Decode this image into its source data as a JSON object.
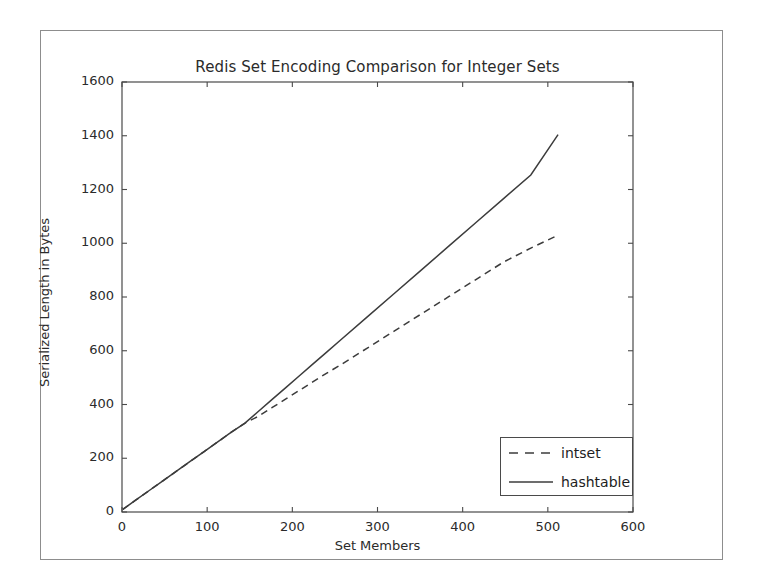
{
  "chart_data": {
    "type": "line",
    "title": "Redis Set Encoding Comparison for Integer Sets",
    "xlabel": "Set Members",
    "ylabel": "Serialized Length in Bytes",
    "xlim": [
      0,
      600
    ],
    "ylim": [
      0,
      1600
    ],
    "xticks": [
      0,
      100,
      200,
      300,
      400,
      500,
      600
    ],
    "yticks": [
      0,
      200,
      400,
      600,
      800,
      1000,
      1200,
      1400,
      1600
    ],
    "xtick_labels": [
      "0",
      "100",
      "200",
      "300",
      "400",
      "500",
      "600"
    ],
    "ytick_labels": [
      "0",
      "200",
      "400",
      "600",
      "800",
      "1000",
      "1200",
      "1400",
      "1600"
    ],
    "grid": false,
    "legend_position": "lower right",
    "series": [
      {
        "name": "intset",
        "style": "dashed",
        "color": "#3c3c3c",
        "x": [
          1,
          16,
          32,
          48,
          64,
          80,
          96,
          112,
          128,
          144,
          160,
          176,
          192,
          208,
          224,
          240,
          256,
          288,
          320,
          352,
          384,
          416,
          448,
          480,
          512
        ],
        "y": [
          10,
          44,
          80,
          116,
          152,
          188,
          224,
          260,
          296,
          330,
          356,
          388,
          420,
          452,
          484,
          516,
          546,
          610,
          674,
          738,
          802,
          866,
          930,
          982,
          1030
        ]
      },
      {
        "name": "hashtable",
        "style": "solid",
        "color": "#3c3c3c",
        "x": [
          1,
          16,
          32,
          48,
          64,
          80,
          96,
          112,
          128,
          144,
          160,
          176,
          192,
          208,
          224,
          240,
          256,
          288,
          320,
          352,
          384,
          416,
          448,
          480,
          512
        ],
        "y": [
          10,
          44,
          80,
          116,
          152,
          188,
          224,
          260,
          296,
          330,
          374,
          418,
          462,
          506,
          550,
          594,
          638,
          726,
          814,
          902,
          990,
          1078,
          1166,
          1254,
          1404
        ]
      }
    ],
    "legend_entries": [
      {
        "label": "intset",
        "style": "dashed"
      },
      {
        "label": "hashtable",
        "style": "solid"
      }
    ]
  }
}
